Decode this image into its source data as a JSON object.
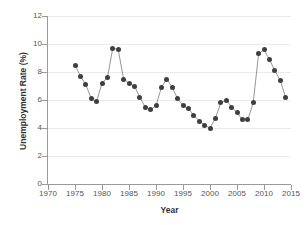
{
  "chart_data": {
    "type": "line",
    "title": "",
    "xlabel": "Year",
    "ylabel": "Unemployment Rate (%)",
    "xlim": [
      1970,
      2015
    ],
    "ylim": [
      0,
      12
    ],
    "xticks": [
      1970,
      1975,
      1980,
      1985,
      1990,
      1995,
      2000,
      2005,
      2010,
      2015
    ],
    "yticks": [
      0,
      2,
      4,
      6,
      8,
      10,
      12
    ],
    "grid": "horizontal",
    "legend": "none",
    "marker": "filled-circle",
    "marker_color": "#3f3f3f",
    "line_color": "#8a8a8a",
    "background_color": "#ffffff",
    "gridline_color": "#ebebeb",
    "x": [
      1975,
      1976,
      1977,
      1978,
      1979,
      1980,
      1981,
      1982,
      1983,
      1984,
      1985,
      1986,
      1987,
      1988,
      1989,
      1990,
      1991,
      1992,
      1993,
      1994,
      1995,
      1996,
      1997,
      1998,
      1999,
      2000,
      2001,
      2002,
      2003,
      2004,
      2005,
      2006,
      2007,
      2008,
      2009,
      2010,
      2011,
      2012,
      2013,
      2014
    ],
    "values": [
      8.5,
      7.7,
      7.1,
      6.1,
      5.9,
      7.2,
      7.6,
      9.7,
      9.6,
      7.5,
      7.2,
      7.0,
      6.2,
      5.5,
      5.3,
      5.6,
      6.9,
      7.5,
      6.9,
      6.1,
      5.6,
      5.4,
      4.9,
      4.5,
      4.2,
      4.0,
      4.7,
      5.8,
      6.0,
      5.5,
      5.1,
      4.6,
      4.6,
      5.8,
      9.3,
      9.6,
      8.9,
      8.1,
      7.4,
      6.2
    ]
  }
}
